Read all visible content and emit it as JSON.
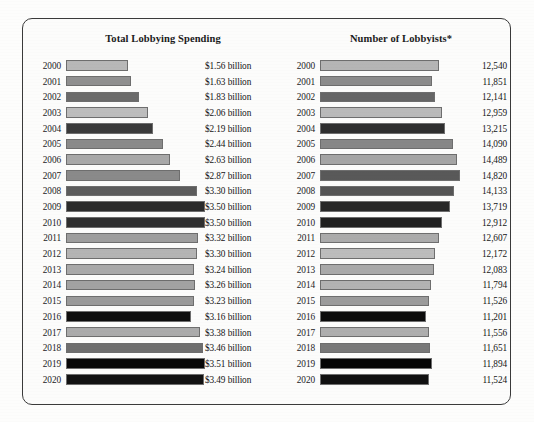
{
  "chart_data": [
    {
      "type": "bar",
      "orientation": "horizontal",
      "title": "Total Lobbying Spending",
      "xlabel": "",
      "ylabel": "",
      "categories": [
        "2000",
        "2001",
        "2002",
        "2003",
        "2004",
        "2005",
        "2006",
        "2007",
        "2008",
        "2009",
        "2010",
        "2011",
        "2012",
        "2013",
        "2014",
        "2015",
        "2016",
        "2017",
        "2018",
        "2019",
        "2020"
      ],
      "values": [
        1.56,
        1.63,
        1.83,
        2.06,
        2.19,
        2.44,
        2.63,
        2.87,
        3.3,
        3.5,
        3.5,
        3.32,
        3.3,
        3.24,
        3.26,
        3.23,
        3.16,
        3.38,
        3.46,
        3.51,
        3.49
      ],
      "value_labels": [
        "$1.56 billion",
        "$1.63 billion",
        "$1.83 billion",
        "$2.06 billion",
        "$2.19 billion",
        "$2.44 billion",
        "$2.63 billion",
        "$2.87 billion",
        "$3.30 billion",
        "$3.50 billion",
        "$3.50 billion",
        "$3.32 billion",
        "$3.30 billion",
        "$3.24 billion",
        "$3.26 billion",
        "$3.23 billion",
        "$3.16 billion",
        "$3.38 billion",
        "$3.46 billion",
        "$3.51 billion",
        "$3.49 billion"
      ],
      "bar_colors": [
        "#b8b8b8",
        "#8f8f8f",
        "#6b6b6b",
        "#bdbdbd",
        "#3a3a3a",
        "#8a8a8a",
        "#a8a8a8",
        "#8a8a8a",
        "#5c5c5c",
        "#2b2b2b",
        "#2f2f2f",
        "#9e9e9e",
        "#b4b4b4",
        "#a9a9a9",
        "#a2a2a2",
        "#9a9a9a",
        "#0d0d0d",
        "#ababab",
        "#6e6e6e",
        "#080808",
        "#121212"
      ],
      "xlim": [
        0,
        3.51
      ],
      "grid": false,
      "legend": "none"
    },
    {
      "type": "bar",
      "orientation": "horizontal",
      "title": "Number of Lobbyists*",
      "xlabel": "",
      "ylabel": "",
      "categories": [
        "2000",
        "2001",
        "2002",
        "2003",
        "2004",
        "2005",
        "2006",
        "2007",
        "2008",
        "2009",
        "2010",
        "2011",
        "2012",
        "2013",
        "2014",
        "2015",
        "2016",
        "2017",
        "2018",
        "2019",
        "2020"
      ],
      "values": [
        12540,
        11851,
        12141,
        12959,
        13215,
        14090,
        14489,
        14820,
        14133,
        13719,
        12912,
        12607,
        12172,
        12083,
        11794,
        11526,
        11201,
        11556,
        11651,
        11894,
        11524
      ],
      "value_labels": [
        "12,540",
        "11,851",
        "12,141",
        "12,959",
        "13,215",
        "14,090",
        "14,489",
        "14,820",
        "14,133",
        "13,719",
        "12,912",
        "12,607",
        "12,172",
        "12,083",
        "11,794",
        "11,526",
        "11,201",
        "11,556",
        "11,651",
        "11,894",
        "11,524"
      ],
      "bar_colors": [
        "#b5b5b5",
        "#8c8c8c",
        "#666666",
        "#bababa",
        "#2e2e2e",
        "#878787",
        "#a5a5a5",
        "#595959",
        "#555555",
        "#272727",
        "#1f1f1f",
        "#ababab",
        "#bcbcbc",
        "#a9a9a9",
        "#b3b3b3",
        "#9b9b9b",
        "#0b0b0b",
        "#aeaeae",
        "#787878",
        "#050505",
        "#101010"
      ],
      "xlim": [
        0,
        14820
      ],
      "grid": false,
      "legend": "none"
    }
  ]
}
